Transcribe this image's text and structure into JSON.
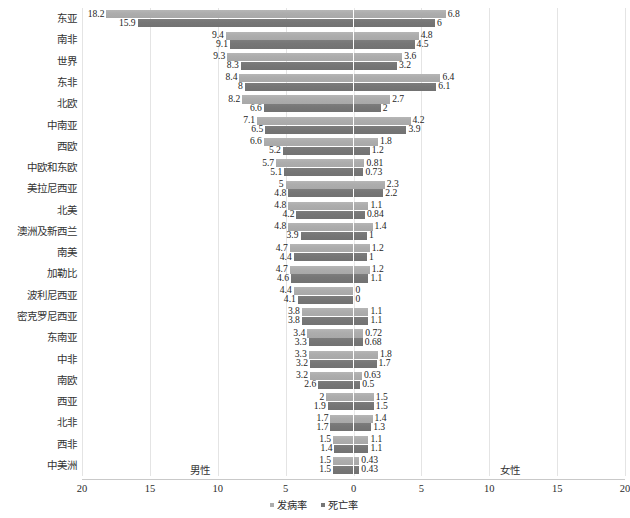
{
  "chart_data": {
    "type": "bar",
    "orientation": "horizontal-diverging",
    "title": "",
    "subtitle": "",
    "xlabel": "",
    "ylabel": "",
    "xlim": [
      -20,
      20
    ],
    "grid": true,
    "xticks": [
      "20",
      "15",
      "10",
      "5",
      "0",
      "5",
      "10",
      "15",
      "20"
    ],
    "xtick_values": [
      20,
      15,
      10,
      5,
      0,
      5,
      10,
      15,
      20
    ],
    "left_side_caption": "男性",
    "right_side_caption": "女性",
    "legend": [
      {
        "label": "发病率",
        "color": "#adadad",
        "marker": "square"
      },
      {
        "label": "死亡率",
        "color": "#767676",
        "marker": "square"
      }
    ],
    "legend_position": "bottom-center",
    "series": [
      {
        "name": "发病率",
        "side": "男性",
        "color": "#adadad"
      },
      {
        "name": "死亡率",
        "side": "男性",
        "color": "#767676"
      },
      {
        "name": "发病率",
        "side": "女性",
        "color": "#adadad"
      },
      {
        "name": "死亡率",
        "side": "女性",
        "color": "#767676"
      }
    ],
    "categories": [
      "东亚",
      "南非",
      "世界",
      "东非",
      "北欧",
      "中南亚",
      "西欧",
      "中欧和东欧",
      "美拉尼西亚",
      "北美",
      "澳洲及新西兰",
      "南美",
      "加勒比",
      "波利尼西亚",
      "密克罗尼西亚",
      "东南亚",
      "中非",
      "南欧",
      "西亚",
      "北非",
      "西非",
      "中美洲"
    ],
    "rows": [
      {
        "category": "东亚",
        "male_incidence": 18.2,
        "male_mortality": 15.9,
        "female_incidence": 6.8,
        "female_mortality": 6,
        "male_incidence_label": "18.2",
        "male_mortality_label": "15.9",
        "female_incidence_label": "6.8",
        "female_mortality_label": "6"
      },
      {
        "category": "南非",
        "male_incidence": 9.4,
        "male_mortality": 9.1,
        "female_incidence": 4.8,
        "female_mortality": 4.5,
        "male_incidence_label": "9.4",
        "male_mortality_label": "9.1",
        "female_incidence_label": "4.8",
        "female_mortality_label": "4.5"
      },
      {
        "category": "世界",
        "male_incidence": 9.3,
        "male_mortality": 8.3,
        "female_incidence": 3.6,
        "female_mortality": 3.2,
        "male_incidence_label": "9.3",
        "male_mortality_label": "8.3",
        "female_incidence_label": "3.6",
        "female_mortality_label": "3.2"
      },
      {
        "category": "东非",
        "male_incidence": 8.4,
        "male_mortality": 8,
        "female_incidence": 6.4,
        "female_mortality": 6.1,
        "male_incidence_label": "8.4",
        "male_mortality_label": "8",
        "female_incidence_label": "6.4",
        "female_mortality_label": "6.1"
      },
      {
        "category": "北欧",
        "male_incidence": 8.2,
        "male_mortality": 6.6,
        "female_incidence": 2.7,
        "female_mortality": 2,
        "male_incidence_label": "8.2",
        "male_mortality_label": "6.6",
        "female_incidence_label": "2.7",
        "female_mortality_label": "2"
      },
      {
        "category": "中南亚",
        "male_incidence": 7.1,
        "male_mortality": 6.5,
        "female_incidence": 4.2,
        "female_mortality": 3.9,
        "male_incidence_label": "7.1",
        "male_mortality_label": "6.5",
        "female_incidence_label": "4.2",
        "female_mortality_label": "3.9"
      },
      {
        "category": "西欧",
        "male_incidence": 6.6,
        "male_mortality": 5.2,
        "female_incidence": 1.8,
        "female_mortality": 1.2,
        "male_incidence_label": "6.6",
        "male_mortality_label": "5.2",
        "female_incidence_label": "1.8",
        "female_mortality_label": "1.2"
      },
      {
        "category": "中欧和东欧",
        "male_incidence": 5.7,
        "male_mortality": 5.1,
        "female_incidence": 0.81,
        "female_mortality": 0.73,
        "male_incidence_label": "5.7",
        "male_mortality_label": "5.1",
        "female_incidence_label": "0.81",
        "female_mortality_label": "0.73"
      },
      {
        "category": "美拉尼西亚",
        "male_incidence": 5,
        "male_mortality": 4.8,
        "female_incidence": 2.3,
        "female_mortality": 2.2,
        "male_incidence_label": "5",
        "male_mortality_label": "4.8",
        "female_incidence_label": "2.3",
        "female_mortality_label": "2.2"
      },
      {
        "category": "北美",
        "male_incidence": 4.8,
        "male_mortality": 4.2,
        "female_incidence": 1.1,
        "female_mortality": 0.84,
        "male_incidence_label": "4.8",
        "male_mortality_label": "4.2",
        "female_incidence_label": "1.1",
        "female_mortality_label": "0.84"
      },
      {
        "category": "澳洲及新西兰",
        "male_incidence": 4.8,
        "male_mortality": 3.9,
        "female_incidence": 1.4,
        "female_mortality": 1,
        "male_incidence_label": "4.8",
        "male_mortality_label": "3.9",
        "female_incidence_label": "1.4",
        "female_mortality_label": "1"
      },
      {
        "category": "南美",
        "male_incidence": 4.7,
        "male_mortality": 4.4,
        "female_incidence": 1.2,
        "female_mortality": 1,
        "male_incidence_label": "4.7",
        "male_mortality_label": "4.4",
        "female_incidence_label": "1.2",
        "female_mortality_label": "1"
      },
      {
        "category": "加勒比",
        "male_incidence": 4.7,
        "male_mortality": 4.6,
        "female_incidence": 1.2,
        "female_mortality": 1.1,
        "male_incidence_label": "4.7",
        "male_mortality_label": "4.6",
        "female_incidence_label": "1.2",
        "female_mortality_label": "1.1"
      },
      {
        "category": "波利尼西亚",
        "male_incidence": 4.4,
        "male_mortality": 4.1,
        "female_incidence": 0,
        "female_mortality": 0,
        "male_incidence_label": "4.4",
        "male_mortality_label": "4.1",
        "female_incidence_label": "0",
        "female_mortality_label": "0"
      },
      {
        "category": "密克罗尼西亚",
        "male_incidence": 3.8,
        "male_mortality": 3.8,
        "female_incidence": 1.1,
        "female_mortality": 1.1,
        "male_incidence_label": "3.8",
        "male_mortality_label": "3.8",
        "female_incidence_label": "1.1",
        "female_mortality_label": "1.1"
      },
      {
        "category": "东南亚",
        "male_incidence": 3.4,
        "male_mortality": 3.3,
        "female_incidence": 0.72,
        "female_mortality": 0.68,
        "male_incidence_label": "3.4",
        "male_mortality_label": "3.3",
        "female_incidence_label": "0.72",
        "female_mortality_label": "0.68"
      },
      {
        "category": "中非",
        "male_incidence": 3.3,
        "male_mortality": 3.2,
        "female_incidence": 1.8,
        "female_mortality": 1.7,
        "male_incidence_label": "3.3",
        "male_mortality_label": "3.2",
        "female_incidence_label": "1.8",
        "female_mortality_label": "1.7"
      },
      {
        "category": "南欧",
        "male_incidence": 3.2,
        "male_mortality": 2.6,
        "female_incidence": 0.63,
        "female_mortality": 0.5,
        "male_incidence_label": "3.2",
        "male_mortality_label": "2.6",
        "female_incidence_label": "0.63",
        "female_mortality_label": "0.5"
      },
      {
        "category": "西亚",
        "male_incidence": 2,
        "male_mortality": 1.9,
        "female_incidence": 1.5,
        "female_mortality": 1.5,
        "male_incidence_label": "2",
        "male_mortality_label": "1.9",
        "female_incidence_label": "1.5",
        "female_mortality_label": "1.5"
      },
      {
        "category": "北非",
        "male_incidence": 1.7,
        "male_mortality": 1.7,
        "female_incidence": 1.4,
        "female_mortality": 1.3,
        "male_incidence_label": "1.7",
        "male_mortality_label": "1.7",
        "female_incidence_label": "1.4",
        "female_mortality_label": "1.3"
      },
      {
        "category": "西非",
        "male_incidence": 1.5,
        "male_mortality": 1.4,
        "female_incidence": 1.1,
        "female_mortality": 1.1,
        "male_incidence_label": "1.5",
        "male_mortality_label": "1.4",
        "female_incidence_label": "1.1",
        "female_mortality_label": "1.1"
      },
      {
        "category": "中美洲",
        "male_incidence": 1.5,
        "male_mortality": 1.5,
        "female_incidence": 0.43,
        "female_mortality": 0.43,
        "male_incidence_label": "1.5",
        "male_mortality_label": "1.5",
        "female_incidence_label": "0.43",
        "female_mortality_label": "0.43"
      }
    ]
  },
  "colors": {
    "incidence": "#adadad",
    "mortality": "#767676",
    "gridline": "#e4e4e4",
    "axis": "#c9c9c9",
    "text": "#2b2b2b",
    "background": "#ffffff"
  }
}
